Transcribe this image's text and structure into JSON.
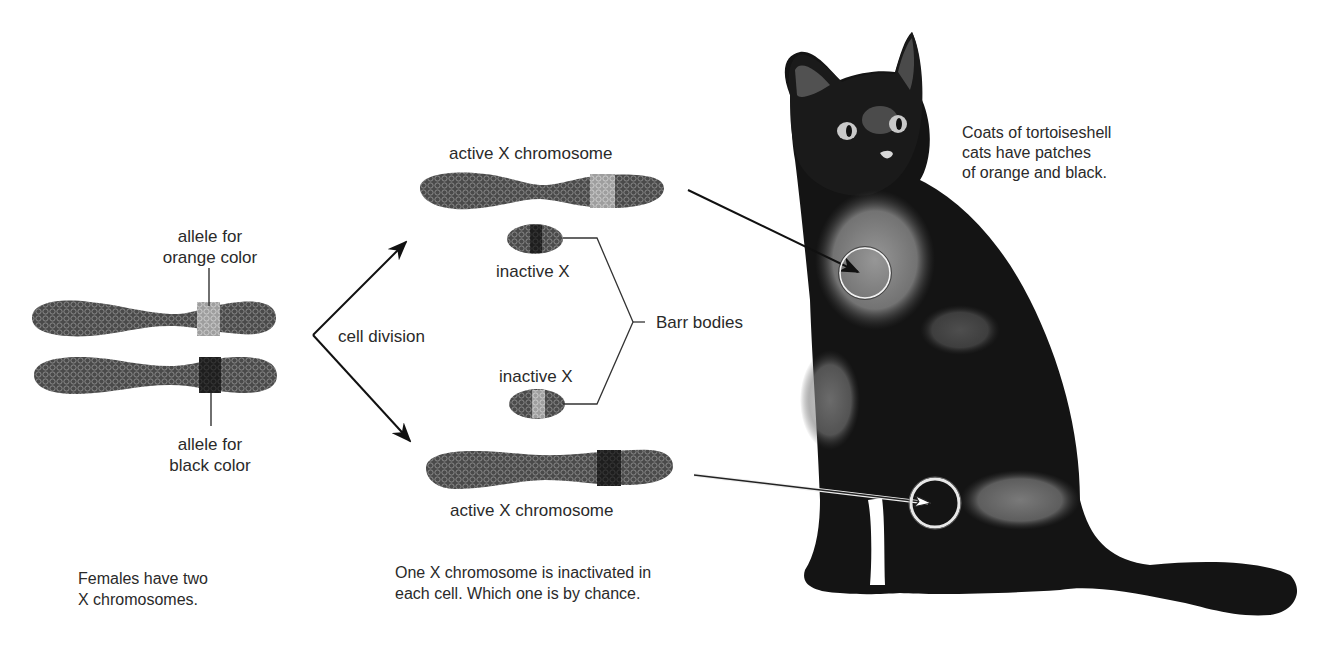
{
  "figure": {
    "type": "diagram",
    "topic": "X-chromosome inactivation in tortoiseshell cats"
  },
  "left_panel": {
    "label_orange_allele": [
      "allele for",
      "orange color"
    ],
    "label_black_allele": [
      "allele for",
      "black color"
    ],
    "caption": [
      "Females have two",
      "X chromosomes."
    ]
  },
  "arrows": {
    "cell_division_label": "cell division"
  },
  "middle_panel": {
    "top_active_label": "active X chromosome",
    "top_inactive_label": "inactive X",
    "bottom_inactive_label": "inactive X",
    "bottom_active_label": "active X chromosome",
    "barr_bodies_label": "Barr bodies",
    "caption": [
      "One X chromosome is inactivated in",
      "each cell. Which one is by chance."
    ]
  },
  "right_panel": {
    "caption": [
      "Coats of tortoiseshell",
      "cats have patches",
      "of orange and black."
    ]
  },
  "colors": {
    "text": "#2a2a2a",
    "chromosome_dark": "#3c3c3c",
    "orange_allele_band": "#a9a9a9",
    "black_allele_band": "#1a1a1a",
    "cat_fur_dark": "#111111",
    "cat_fur_light": "#8a8a8a",
    "background": "#ffffff"
  }
}
